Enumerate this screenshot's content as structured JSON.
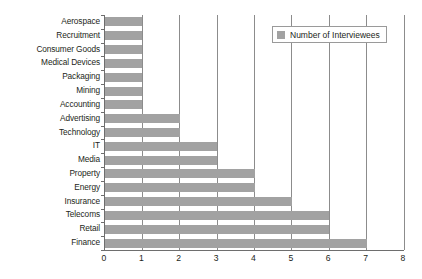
{
  "chart_data": {
    "type": "bar",
    "orientation": "horizontal",
    "title": "",
    "subtitle": "",
    "xlabel": "",
    "ylabel": "",
    "xlim": [
      0,
      8
    ],
    "xticks": [
      "0",
      "1",
      "2",
      "3",
      "4",
      "5",
      "6",
      "7",
      "8"
    ],
    "grid": "vertical-gridlines-at-each-integer",
    "legend": {
      "position": "top-right",
      "entries": [
        {
          "label": "Number of Interviewees",
          "color": "#a2a2a2"
        }
      ]
    },
    "series": [
      {
        "name": "Number of Interviewees",
        "color": "#a2a2a2",
        "values": [
          1,
          1,
          1,
          1,
          1,
          1,
          1,
          2,
          2,
          3,
          3,
          4,
          4,
          5,
          6,
          6,
          7
        ]
      }
    ],
    "categories": [
      "Aerospace",
      "Recruitment",
      "Consumer Goods",
      "Medical Devices",
      "Packaging",
      "Mining",
      "Accounting",
      "Advertising",
      "Technology",
      "IT",
      "Media",
      "Property",
      "Energy",
      "Insurance",
      "Telecoms",
      "Retail",
      "Finance"
    ]
  },
  "colors": {
    "bar": "#a2a2a2",
    "gridline": "#8c8c8c",
    "axis": "#6e6e6e",
    "background": "#ffffff",
    "text": "#231f20"
  }
}
